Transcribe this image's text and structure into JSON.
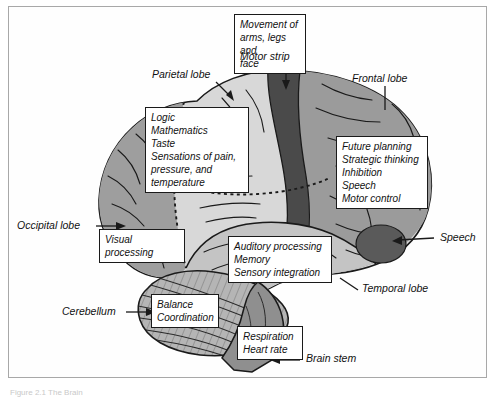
{
  "figure": {
    "caption": "Figure 2.1  The Brain"
  },
  "palette": {
    "motor_strip": "#4a4a4a",
    "frontal_lobe": "#9b9b9b",
    "parietal_lobe": "#d8d8d8",
    "occipital_lobe": "#9e9e9e",
    "temporal_lobe": "#c4c4c4",
    "cerebellum": "#b5b5b5",
    "brain_stem": "#8f8f8f",
    "outline": "#1a1a1a",
    "frame": "#a8a8a8",
    "leader": "#1a1a1a",
    "box_fill": "#ffffff"
  },
  "labels": [
    {
      "id": "motor-strip",
      "text": "Motor strip"
    },
    {
      "id": "parietal-lobe",
      "text": "Parietal lobe"
    },
    {
      "id": "frontal-lobe",
      "text": "Frontal lobe"
    },
    {
      "id": "occipital-lobe",
      "text": "Occipital lobe"
    },
    {
      "id": "speech",
      "text": "Speech"
    },
    {
      "id": "temporal-lobe",
      "text": "Temporal lobe"
    },
    {
      "id": "cerebellum",
      "text": "Cerebellum"
    },
    {
      "id": "brain-stem",
      "text": "Brain stem"
    }
  ],
  "callouts": [
    {
      "id": "motor-functions",
      "region": "Motor strip",
      "text": "Movement of\narms, legs and\nface"
    },
    {
      "id": "parietal-functions",
      "region": "Parietal lobe",
      "text": "Logic\nMathematics\nTaste\nSensations of pain,\npressure, and\ntemperature"
    },
    {
      "id": "frontal-functions",
      "region": "Frontal lobe",
      "text": "Future planning\nStrategic thinking\nInhibition\nSpeech\nMotor control"
    },
    {
      "id": "occipital-functions",
      "region": "Occipital lobe",
      "text": "Visual processing"
    },
    {
      "id": "temporal-functions",
      "region": "Temporal lobe",
      "text": "Auditory processing\nMemory\nSensory integration"
    },
    {
      "id": "cerebellum-functions",
      "region": "Cerebellum",
      "text": "Balance\nCoordination"
    },
    {
      "id": "brainstem-functions",
      "region": "Brain stem",
      "text": "Respiration\nHeart  rate"
    }
  ]
}
